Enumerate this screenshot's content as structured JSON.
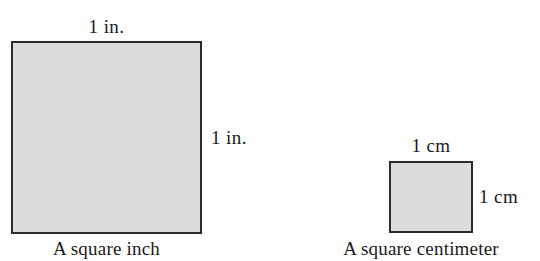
{
  "figure": {
    "background_color": "#ffffff",
    "width": 540,
    "height": 261
  },
  "shapes": {
    "square_inch": {
      "name": "square-inch",
      "fill_color": "#dcdcdc",
      "stroke_color": "#2b2b2b",
      "top_label": "1 in.",
      "right_label": "1 in.",
      "caption": "A square inch"
    },
    "square_centimeter": {
      "name": "square-centimeter",
      "fill_color": "#dcdcdc",
      "stroke_color": "#2b2b2b",
      "top_label": "1 cm",
      "right_label": "1 cm",
      "caption": "A square centimeter"
    }
  }
}
